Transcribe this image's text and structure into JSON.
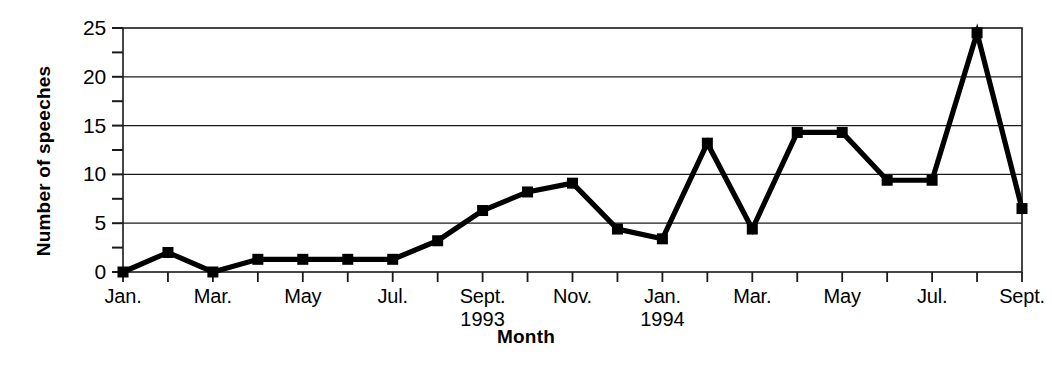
{
  "chart_data": {
    "type": "line",
    "title": "",
    "xlabel": "Month",
    "ylabel": "Number of speeches",
    "ylim": [
      0,
      25
    ],
    "yticks": [
      0,
      5,
      10,
      15,
      20,
      25
    ],
    "ytick_labels": [
      "0",
      "5",
      "10",
      "15",
      "20",
      "25"
    ],
    "y_minor_ticks": [
      2.5,
      7.5,
      12.5,
      17.5,
      22.5
    ],
    "grid": "horizontal-major",
    "legend": "none",
    "marker": "filled-square",
    "line_color": "#000000",
    "categories": [
      "Jan.",
      "Feb.",
      "Mar.",
      "Apr.",
      "May",
      "Jun.",
      "Jul.",
      "Aug.",
      "Sept.",
      "Oct.",
      "Nov.",
      "Dec.",
      "Jan.",
      "Feb.",
      "Mar.",
      "Apr.",
      "May",
      "Jun.",
      "Jul.",
      "Aug.",
      "Sept."
    ],
    "xtick_labels": [
      "Jan.",
      "Mar.",
      "May",
      "Jul.",
      "Sept.",
      "Nov.",
      "Jan.",
      "Mar.",
      "May",
      "Jul.",
      "Sept."
    ],
    "xtick_years": [
      "",
      "",
      "",
      "",
      "1993",
      "",
      "1994",
      "",
      "",
      "",
      ""
    ],
    "values": [
      0.0,
      2.0,
      0.0,
      1.3,
      1.3,
      1.3,
      1.3,
      3.2,
      6.3,
      8.2,
      9.1,
      4.4,
      3.4,
      13.2,
      4.4,
      14.3,
      14.3,
      9.4,
      9.4,
      24.5,
      6.5
    ],
    "points": [
      {
        "label": "Jan. 1993",
        "value": 0.0
      },
      {
        "label": "Feb. 1993",
        "value": 2.0
      },
      {
        "label": "Mar. 1993",
        "value": 0.0
      },
      {
        "label": "Apr. 1993",
        "value": 1.3
      },
      {
        "label": "May 1993",
        "value": 1.3
      },
      {
        "label": "Jun. 1993",
        "value": 1.3
      },
      {
        "label": "Jul. 1993",
        "value": 1.3
      },
      {
        "label": "Aug. 1993",
        "value": 3.2
      },
      {
        "label": "Sept. 1993",
        "value": 6.3
      },
      {
        "label": "Oct. 1993",
        "value": 8.2
      },
      {
        "label": "Nov. 1993",
        "value": 9.1
      },
      {
        "label": "Dec. 1993",
        "value": 4.4
      },
      {
        "label": "Jan. 1994",
        "value": 3.4
      },
      {
        "label": "Feb. 1994",
        "value": 13.2
      },
      {
        "label": "Mar. 1994",
        "value": 4.4
      },
      {
        "label": "Apr. 1994",
        "value": 14.3
      },
      {
        "label": "May 1994",
        "value": 14.3
      },
      {
        "label": "Jun. 1994",
        "value": 9.4
      },
      {
        "label": "Jul. 1994",
        "value": 9.4
      },
      {
        "label": "Aug. 1994",
        "value": 24.5
      },
      {
        "label": "Sept. 1994",
        "value": 6.5
      }
    ]
  }
}
